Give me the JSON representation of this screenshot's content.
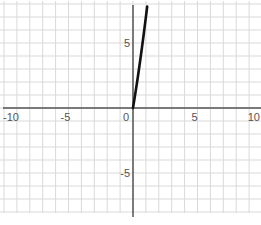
{
  "chart_data": {
    "type": "line",
    "title": "",
    "xlabel": "",
    "ylabel": "",
    "xlim": [
      -10,
      10
    ],
    "ylim": [
      -8,
      8
    ],
    "grid": true,
    "grid_step": 1,
    "x_ticks": [
      {
        "value": -10,
        "label": "-10"
      },
      {
        "value": -5,
        "label": "-5"
      },
      {
        "value": 0,
        "label": "0"
      },
      {
        "value": 5,
        "label": "5"
      },
      {
        "value": 10,
        "label": "10"
      }
    ],
    "y_ticks": [
      {
        "value": 5,
        "label": "5"
      },
      {
        "value": -5,
        "label": "-5"
      }
    ],
    "series": [
      {
        "name": "curve",
        "color": "#111111",
        "x": [
          0,
          0.1,
          0.2,
          0.3,
          0.4,
          0.5,
          0.6,
          0.7,
          0.8,
          0.9,
          1.0,
          1.1
        ],
        "y": [
          0,
          0.61,
          1.24,
          1.89,
          2.56,
          3.25,
          3.96,
          4.69,
          5.44,
          6.21,
          7.0,
          7.81
        ]
      }
    ]
  },
  "colors": {
    "grid": "#d9d9d9",
    "axis": "#555555",
    "curve": "#111111"
  }
}
